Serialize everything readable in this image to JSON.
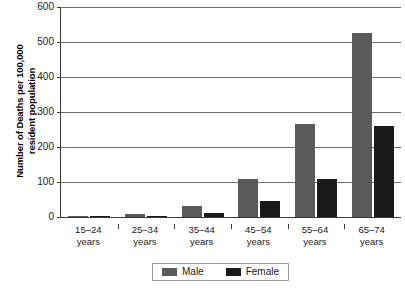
{
  "chart_data": {
    "type": "bar",
    "title": "",
    "subtitle": "",
    "xlabel": "",
    "ylabel": "Number of Deaths per 100,000\nresident population",
    "ylim": [
      0,
      600
    ],
    "ytick_values": [
      0,
      100,
      200,
      300,
      400,
      500,
      600
    ],
    "ytick_labels": [
      "0",
      "100",
      "200",
      "300",
      "400",
      "500",
      "600"
    ],
    "grid": true,
    "legend_position": "bottom-center",
    "categories": [
      "15–24\nyears",
      "25–34\nyears",
      "35–44\nyears",
      "45–54\nyears",
      "55–64\nyears",
      "65–74\nyears"
    ],
    "series": [
      {
        "name": "Male",
        "color": "#5a5a5a",
        "values": [
          2,
          9,
          32,
          108,
          265,
          526
        ]
      },
      {
        "name": "Female",
        "color": "#1a1a1a",
        "values": [
          1,
          4,
          12,
          46,
          110,
          260
        ]
      }
    ]
  },
  "legend": {
    "items": [
      {
        "label": "Male",
        "color": "#5a5a5a"
      },
      {
        "label": "Female",
        "color": "#1a1a1a"
      }
    ]
  },
  "axis": {
    "y_title": "Number of Deaths per 100,000\nresident population"
  }
}
